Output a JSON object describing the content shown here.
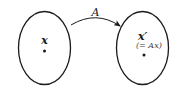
{
  "diagram": {
    "mapping_label": "A",
    "left_set": {
      "point_label": "x"
    },
    "right_set": {
      "point_label": "x′",
      "annotation": "(= Ax)"
    },
    "colors": {
      "stroke": "#1a1a1a",
      "text": "#1a1a1a",
      "annotation_text": "#444444",
      "background": "#ffffff"
    }
  }
}
